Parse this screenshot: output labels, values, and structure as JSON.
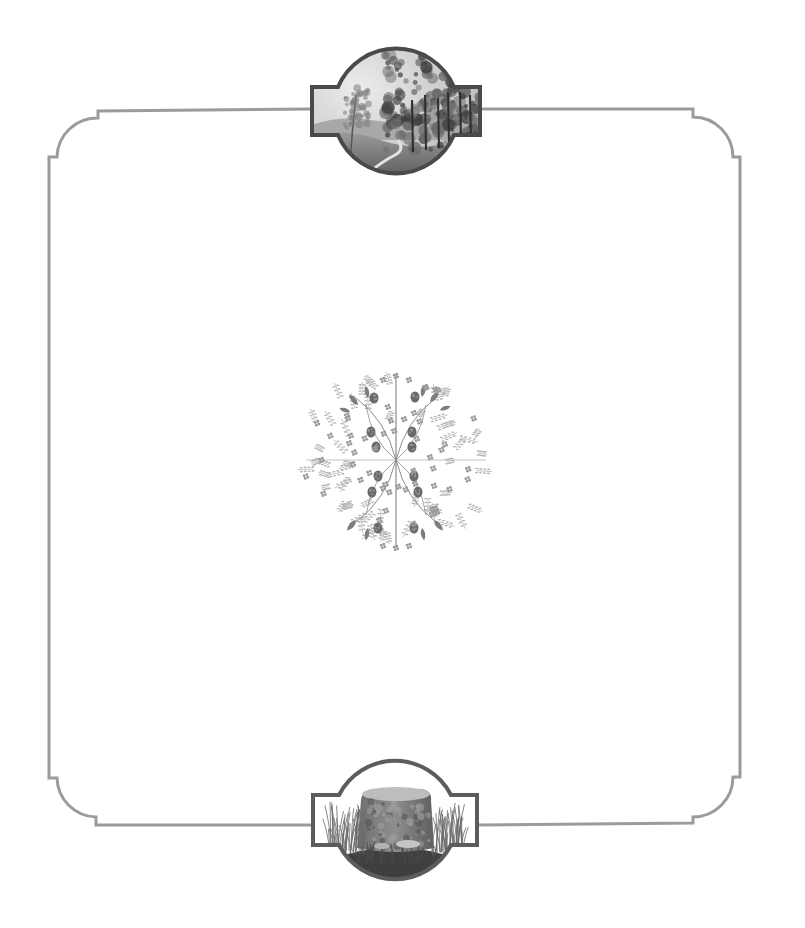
{
  "page": {
    "type": "decorative-book-page",
    "background": "#ffffff",
    "frame_color": "#9b9b9b"
  },
  "top_medallion": {
    "subject": "landscape-painting",
    "description": "Woodland landscape with trees, distant hills and a path",
    "tones": {
      "sky": "#d9d9d9",
      "trees_dark": "#3e3e3e",
      "trees_mid": "#6d6d6d",
      "ground": "#8a8a8a",
      "border": "#4a4a4a"
    }
  },
  "bottom_medallion": {
    "subject": "tree-stump-painting",
    "description": "Mossy tree stump surrounded by grasses and mushrooms",
    "tones": {
      "stump": "#7a7a7a",
      "stump_top": "#b5b5b5",
      "grass": "#5a5a5a",
      "ground": "#3a3a3a",
      "border": "#5c5c5c"
    }
  },
  "center_ornament": {
    "subject": "floral-roundel",
    "description": "Circular botanical ornament with raspberry branches, leaves and small flowers",
    "tones": {
      "leaf": "#7d7d7d",
      "berry": "#6a6a6a",
      "stem": "#8c8c8c",
      "flower": "#9a9a9a",
      "fern": "#b4b4b4"
    }
  }
}
